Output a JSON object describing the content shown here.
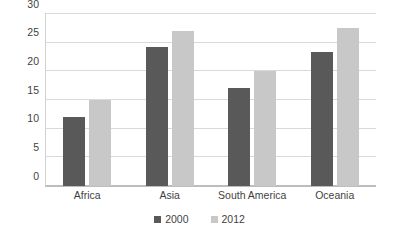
{
  "chart_data": {
    "type": "bar",
    "title": "",
    "subtitle": "",
    "xlabel": "",
    "ylabel": "",
    "categories": [
      "Africa",
      "Asia",
      "South America",
      "Oceania"
    ],
    "series": [
      {
        "name": "2000",
        "color": "#595959",
        "values": [
          12.1,
          24.2,
          17.1,
          23.3
        ]
      },
      {
        "name": "2012",
        "color": "#c8c8c8",
        "values": [
          15.0,
          27.0,
          20.1,
          27.5
        ]
      }
    ],
    "ylim": [
      0,
      30
    ],
    "y_ticks": [
      0,
      5,
      10,
      15,
      20,
      25,
      30
    ],
    "y_tick_labels": [
      "0",
      "5",
      "10",
      "15",
      "20",
      "25",
      "30"
    ],
    "grid": true,
    "grid_axis": "y",
    "legend_position": "bottom",
    "legend_entries": [
      "2000",
      "2012"
    ],
    "annotations": [],
    "background_color": "#ffffff",
    "gridline_color": "#d9d9d9",
    "axis_color": "#bdbdbd",
    "text_color": "#3f3f3f"
  }
}
